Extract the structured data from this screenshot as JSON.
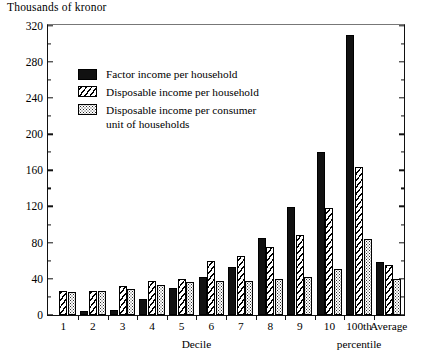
{
  "chart_data": {
    "type": "bar",
    "title": "Thousands of kronor",
    "xlabel": "Decile",
    "ylabel": "Thousands of kronor",
    "ylim": [
      0,
      320
    ],
    "ytick_step": 40,
    "yminor_step": 20,
    "grid": false,
    "legend_position": "upper-left inside plot",
    "categories": [
      "1",
      "2",
      "3",
      "4",
      "5",
      "6",
      "7",
      "8",
      "9",
      "10",
      "100th percentile",
      "Average"
    ],
    "category_labels_line1": [
      "1",
      "2",
      "3",
      "4",
      "5",
      "6",
      "7",
      "8",
      "9",
      "10",
      "100th",
      "Average"
    ],
    "category_labels_line2": [
      "",
      "",
      "",
      "",
      "",
      "",
      "",
      "",
      "",
      "",
      "percentile",
      ""
    ],
    "ytick_labels": [
      "0",
      "40",
      "80",
      "120",
      "160",
      "200",
      "240",
      "280",
      "320"
    ],
    "series": [
      {
        "name": "Factor income per household",
        "pattern": "solid-black",
        "values": [
          0,
          4,
          6,
          18,
          30,
          42,
          53,
          85,
          119,
          180,
          310,
          59
        ]
      },
      {
        "name": "Disposable income per household",
        "pattern": "diagonal-hatch",
        "values": [
          26,
          27,
          32,
          38,
          40,
          60,
          65,
          75,
          88,
          118,
          164,
          55
        ]
      },
      {
        "name": "Disposable income per consumer unit of households",
        "pattern": "dotted",
        "values": [
          25,
          26,
          29,
          33,
          37,
          38,
          38,
          40,
          42,
          51,
          84,
          40
        ]
      }
    ],
    "legend_entries": [
      {
        "label": "Factor income per household",
        "label_line2": ""
      },
      {
        "label": "Disposable income per household",
        "label_line2": ""
      },
      {
        "label": "Disposable income per consumer",
        "label_line2": "unit of households"
      }
    ],
    "colors": {
      "ink": "#000000",
      "solid_fill": "#111111",
      "background": "#ffffff"
    }
  }
}
